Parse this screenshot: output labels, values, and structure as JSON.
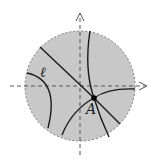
{
  "diagram": {
    "type": "poincare-disk",
    "disk": {
      "cx": 80,
      "cy": 86,
      "r": 55,
      "fill": "#c8c8c8",
      "stroke": "#777777"
    },
    "axes": {
      "color": "#555555",
      "x_arrow": "right",
      "y_arrow": "up"
    },
    "point_A": {
      "x": 94,
      "y": 98,
      "label": "A"
    },
    "line_l_label": "ℓ",
    "geodesics_color": "#1a1a1a"
  }
}
